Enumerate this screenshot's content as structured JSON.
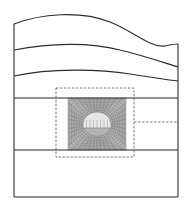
{
  "diagram": {
    "type": "geological-cross-section-with-tunnel-mesh",
    "colors": {
      "line": "#2a2a2a",
      "dashed": "#555555",
      "mesh_fill": "#b4b4b4",
      "mesh_line": "#6e6e6e",
      "mesh_light": "#e6e6e6",
      "background": "#ffffff"
    },
    "model_boundary": {
      "left": 14,
      "right": 178,
      "bottom": 197
    },
    "strata_curves": [
      {
        "name": "ground-surface",
        "path": "M14,24 C40,14 80,10 110,22 C135,32 150,48 165,46 C170,45 174,44 178,44"
      },
      {
        "name": "layer-boundary-1",
        "path": "M14,50 C50,43 90,42 120,50 C145,56 165,63 178,67"
      },
      {
        "name": "layer-boundary-2",
        "path": "M14,76 C50,68 100,69 130,74 C155,78 170,80 178,81"
      }
    ],
    "horizontal_boundaries": [
      98,
      150
    ],
    "refined_zone": {
      "x": 56,
      "y": 88,
      "width": 78,
      "height": 69
    },
    "mesh_region": {
      "x": 68,
      "y": 98,
      "width": 58,
      "height": 52
    },
    "tunnel": {
      "cx": 97,
      "cy": 124,
      "rx": 14,
      "ry": 12,
      "invert_y": 128
    },
    "leader_line": {
      "x1": 134,
      "x2": 178,
      "y": 122
    }
  }
}
